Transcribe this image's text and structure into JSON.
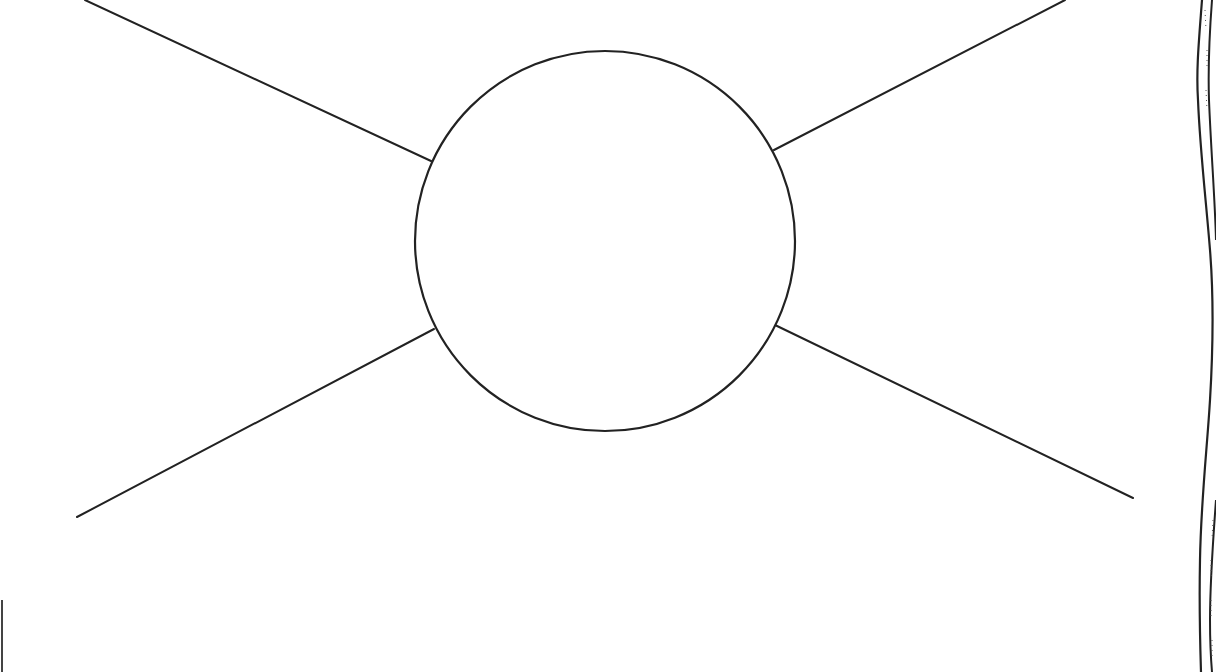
{
  "diagram": {
    "type": "spider-map-template",
    "background": "#ffffff",
    "stroke_color": "#222222",
    "center_circle": {
      "cx": 605,
      "cy": 241,
      "r": 190,
      "label": ""
    },
    "spokes": [
      {
        "name": "top-left",
        "x1": 85,
        "y1": 0,
        "x2": 431,
        "y2": 161,
        "label": ""
      },
      {
        "name": "top-right",
        "x1": 1065,
        "y1": 0,
        "x2": 774,
        "y2": 150,
        "label": ""
      },
      {
        "name": "bottom-left",
        "x1": 77,
        "y1": 517,
        "x2": 434,
        "y2": 329,
        "label": ""
      },
      {
        "name": "bottom-right",
        "x1": 1133,
        "y1": 498,
        "x2": 775,
        "y2": 325,
        "label": ""
      }
    ],
    "page_edge": {
      "side": "right",
      "style": "torn-paper"
    }
  }
}
